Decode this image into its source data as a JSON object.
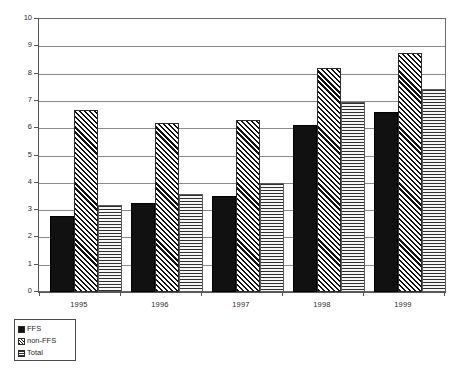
{
  "chart_data": {
    "type": "bar",
    "title": "",
    "subtitle": "",
    "xlabel": "",
    "ylabel": "",
    "categories": [
      "1995",
      "1996",
      "1997",
      "1998",
      "1999"
    ],
    "series": [
      {
        "name": "FFS",
        "pattern": "solid-black",
        "values": [
          2.8,
          3.25,
          3.5,
          6.1,
          6.6
        ]
      },
      {
        "name": "non-FFS",
        "pattern": "diagonal-hatch",
        "values": [
          6.65,
          6.2,
          6.3,
          8.2,
          8.75
        ]
      },
      {
        "name": "Total",
        "pattern": "horizontal-lines",
        "values": [
          3.2,
          3.6,
          4.0,
          6.95,
          7.45
        ]
      }
    ],
    "ylim": [
      0,
      10
    ],
    "ytick_labels": [
      "0",
      "1",
      "2",
      "3",
      "4",
      "5",
      "6",
      "7",
      "8",
      "9",
      "10"
    ],
    "ytick_values": [
      0,
      1,
      2,
      3,
      4,
      5,
      6,
      7,
      8,
      9,
      10
    ],
    "grid": true,
    "grid_axis": "y",
    "legend_position": "bottom-left",
    "legend_entries": [
      "FFS",
      "non-FFS",
      "Total"
    ],
    "annotations": []
  },
  "colors": {
    "ffs": "#111111",
    "nonffs": "#2a2a2a",
    "total": "#5a5a5a",
    "grid": "#8a8a8a",
    "axis": "#555555",
    "frame": "#6b6b6b",
    "background": "#ffffff",
    "text": "#2b2b2b"
  }
}
